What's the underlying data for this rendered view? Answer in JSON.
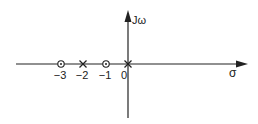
{
  "diagram": {
    "type": "pole-zero plot",
    "axes": {
      "horizontal_label": "σ",
      "vertical_label": "Jω"
    },
    "ticks": [
      {
        "value": -3,
        "label": "−3"
      },
      {
        "value": -2,
        "label": "−2"
      },
      {
        "value": -1,
        "label": "−1"
      },
      {
        "value": 0,
        "label": "0"
      }
    ],
    "zeros": [
      -3,
      -1
    ],
    "poles": [
      -2,
      0
    ],
    "colors": {
      "line": "#222222",
      "background": "#ffffff"
    }
  }
}
